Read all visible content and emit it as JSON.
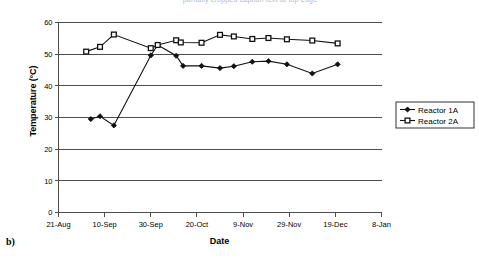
{
  "panel_tag": "b)",
  "cut_title": "partially cropped caption text at top edge",
  "legend": {
    "position": "right",
    "items": [
      {
        "label": "Reactor 1A",
        "marker": "filled-diamond"
      },
      {
        "label": "Reactor 2A",
        "marker": "open-square"
      }
    ]
  },
  "chart_data": {
    "type": "line",
    "title": "",
    "xlabel": "Date",
    "ylabel": "Temperature (°C)",
    "ylim": [
      0,
      60
    ],
    "ytick_step": 10,
    "yticks": [
      0,
      10,
      20,
      30,
      40,
      50,
      60
    ],
    "xticks": [
      "21-Aug",
      "10-Sep",
      "30-Sep",
      "20-Oct",
      "9-Nov",
      "29-Nov",
      "19-Dec",
      "8-Jan"
    ],
    "xtick_days": [
      0,
      20,
      40,
      60,
      80,
      100,
      120,
      140
    ],
    "xlim_days": [
      0,
      140
    ],
    "grid": "horizontal",
    "legend_position": "right",
    "series": [
      {
        "name": "Reactor 1A",
        "marker": "filled-diamond",
        "color": "#111111",
        "points": [
          {
            "x": "14-Sep",
            "day": 14,
            "y": 29.5
          },
          {
            "x": "18-Sep",
            "day": 18,
            "y": 30.4
          },
          {
            "x": "24-Sep",
            "day": 24,
            "y": 27.5
          },
          {
            "x": "30-Sep",
            "day": 40,
            "y": 49.6
          },
          {
            "x": "3-Oct",
            "day": 43,
            "y": 52.9
          },
          {
            "x": "11-Oct",
            "day": 51,
            "y": 49.5
          },
          {
            "x": "14-Oct",
            "day": 54,
            "y": 46.3
          },
          {
            "x": "22-Oct",
            "day": 62,
            "y": 46.3
          },
          {
            "x": "30-Oct",
            "day": 70,
            "y": 45.6
          },
          {
            "x": "5-Nov",
            "day": 76,
            "y": 46.2
          },
          {
            "x": "13-Nov",
            "day": 84,
            "y": 47.6
          },
          {
            "x": "20-Nov",
            "day": 91,
            "y": 47.8
          },
          {
            "x": "28-Nov",
            "day": 99,
            "y": 46.8
          },
          {
            "x": "9-Dec",
            "day": 110,
            "y": 43.9
          },
          {
            "x": "20-Dec",
            "day": 121,
            "y": 46.8
          }
        ]
      },
      {
        "name": "Reactor 2A",
        "marker": "open-square",
        "color": "#111111",
        "points": [
          {
            "x": "2-Sep",
            "day": 12,
            "y": 50.8
          },
          {
            "x": "8-Sep",
            "day": 18,
            "y": 52.3
          },
          {
            "x": "14-Sep",
            "day": 24,
            "y": 56.2
          },
          {
            "x": "30-Sep",
            "day": 40,
            "y": 51.9
          },
          {
            "x": "3-Oct",
            "day": 43,
            "y": 52.9
          },
          {
            "x": "11-Oct",
            "day": 51,
            "y": 54.4
          },
          {
            "x": "13-Oct",
            "day": 53,
            "y": 53.7
          },
          {
            "x": "22-Oct",
            "day": 62,
            "y": 53.6
          },
          {
            "x": "30-Oct",
            "day": 70,
            "y": 56.1
          },
          {
            "x": "36-Oct",
            "day": 76,
            "y": 55.6
          },
          {
            "x": "13-Nov",
            "day": 84,
            "y": 54.8
          },
          {
            "x": "20-Nov",
            "day": 91,
            "y": 55.1
          },
          {
            "x": "28-Nov",
            "day": 99,
            "y": 54.7
          },
          {
            "x": "9-Dec",
            "day": 110,
            "y": 54.3
          },
          {
            "x": "20-Dec",
            "day": 121,
            "y": 53.4
          }
        ]
      }
    ]
  }
}
